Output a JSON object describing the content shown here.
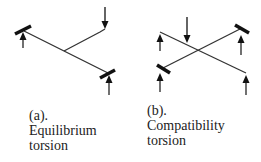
{
  "figures": [
    {
      "id": "a",
      "label": "(a).",
      "title_line1": "Equilibrium",
      "title_line2": "torsion"
    },
    {
      "id": "b",
      "label": "(b).",
      "title_line1": "Compatibility",
      "title_line2": "torsion"
    }
  ],
  "colors": {
    "line": "#333333",
    "text": "#222222"
  }
}
